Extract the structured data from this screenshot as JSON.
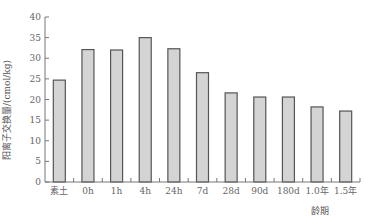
{
  "chart_data": {
    "type": "bar",
    "title": "",
    "xlabel": "龄期",
    "ylabel": "阳离子交换量/(cmol/kg)",
    "ylim": [
      0,
      40
    ],
    "yticks": [
      0,
      5,
      10,
      15,
      20,
      25,
      30,
      35,
      40
    ],
    "grid": false,
    "legend": null,
    "categories": [
      "素土",
      "0h",
      "1h",
      "4h",
      "24h",
      "7d",
      "28d",
      "90d",
      "180d",
      "1.0年",
      "1.5年"
    ],
    "values": [
      24.7,
      32.1,
      32.0,
      35.0,
      32.3,
      26.5,
      21.6,
      20.6,
      20.6,
      18.2,
      17.2
    ],
    "bar_color": "#d4d4d4",
    "bar_edge_color": "#555555"
  }
}
